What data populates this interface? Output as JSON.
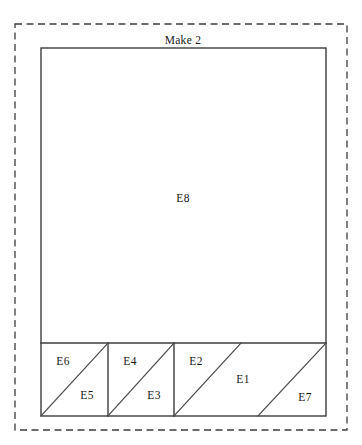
{
  "diagram": {
    "type": "quilt-block-assembly",
    "title": "Make 2",
    "background_color": "#ffffff",
    "line_color": "#3d3d3d",
    "patch_fill_color": "#ffffff",
    "dashed_frame": {
      "x": 15,
      "y": 24,
      "width": 332,
      "height": 406,
      "dash_pattern": "7 4.5"
    },
    "block_outline": {
      "x": 41,
      "y": 48,
      "width": 285,
      "height": 368
    },
    "divider_y": 343,
    "vertical_dividers": [
      108,
      174
    ],
    "pieces": [
      {
        "id": "E8",
        "label": "E8",
        "shape": "rectangle",
        "label_x": 183,
        "label_y": 199,
        "region": {
          "x": 41,
          "y": 48,
          "width": 285,
          "height": 295
        }
      },
      {
        "id": "E6",
        "label": "E6",
        "shape": "triangle",
        "label_x": 63,
        "label_y": 362,
        "points": "41,343 108,343 41,416"
      },
      {
        "id": "E5",
        "label": "E5",
        "shape": "triangle",
        "label_x": 87,
        "label_y": 396,
        "points": "108,343 108,416 41,416"
      },
      {
        "id": "E4",
        "label": "E4",
        "shape": "triangle",
        "label_x": 130,
        "label_y": 362,
        "points": "108,343 174,343 108,416"
      },
      {
        "id": "E3",
        "label": "E3",
        "shape": "triangle",
        "label_x": 154,
        "label_y": 396,
        "points": "174,343 174,416 108,416"
      },
      {
        "id": "E2",
        "label": "E2",
        "shape": "triangle",
        "label_x": 196,
        "label_y": 362,
        "points": "174,343 241,343 174,416"
      },
      {
        "id": "E1",
        "label": "E1",
        "shape": "parallelogram",
        "label_x": 243,
        "label_y": 380,
        "points": "241,343 326,343 258,416 174,416"
      },
      {
        "id": "E7",
        "label": "E7",
        "shape": "triangle",
        "label_x": 305,
        "label_y": 398,
        "points": "326,343 326,416 258,416"
      }
    ],
    "diagonals": [
      {
        "name": "e6-e5-seam",
        "x1": 41,
        "y1": 416,
        "x2": 108,
        "y2": 343
      },
      {
        "name": "e4-e3-seam",
        "x1": 108,
        "y1": 416,
        "x2": 174,
        "y2": 343
      },
      {
        "name": "e2-e1-seam",
        "x1": 174,
        "y1": 416,
        "x2": 241,
        "y2": 343
      },
      {
        "name": "e1-e7-seam",
        "x1": 258,
        "y1": 416,
        "x2": 326,
        "y2": 343
      }
    ],
    "title_position": {
      "x": 183,
      "y": 41
    }
  }
}
